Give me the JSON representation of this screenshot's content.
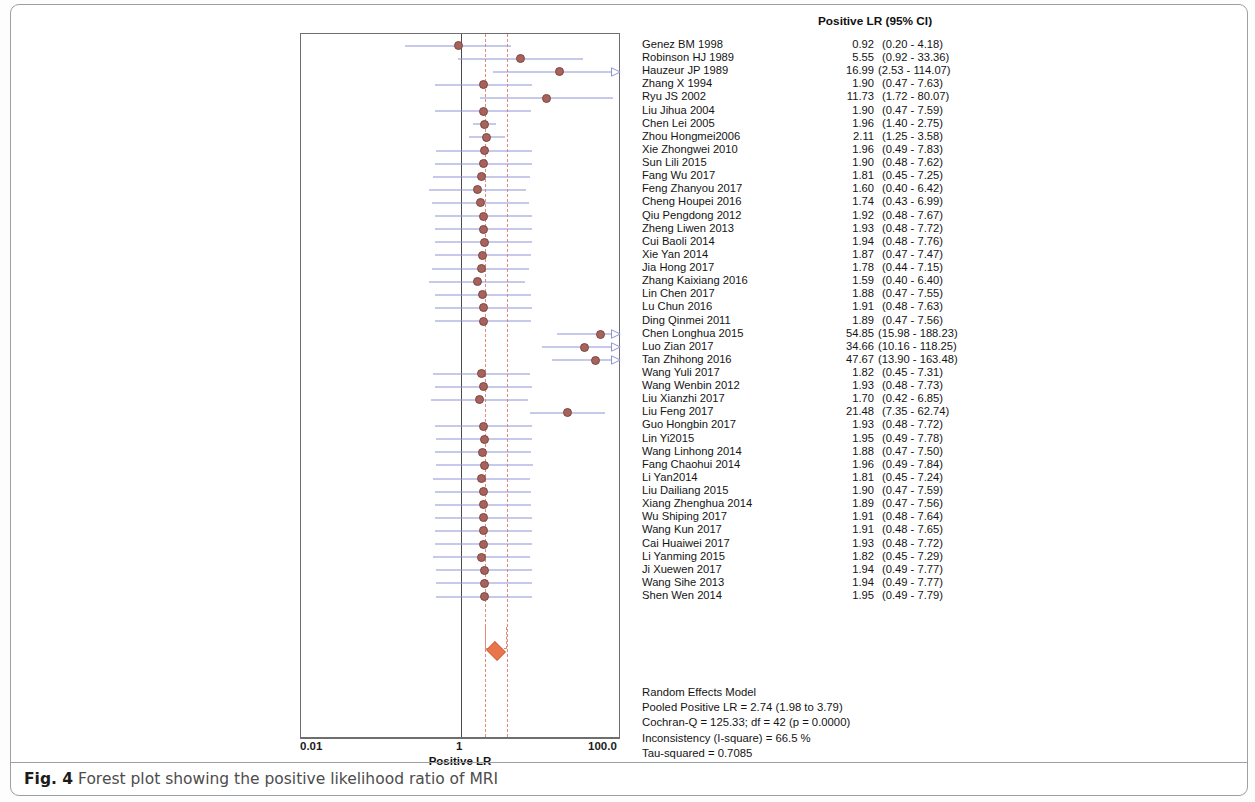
{
  "figure": {
    "caption_label": "Fig. 4",
    "caption_text": "Forest plot showing the positive likelihood ratio of MRI"
  },
  "column_header": "Positive LR (95% CI)",
  "axis": {
    "label": "Positive LR",
    "ticks": [
      "0.01",
      "1",
      "100.0"
    ],
    "min": 0.01,
    "max": 100.0,
    "reference_line": 1,
    "dashed_lines": [
      1.98,
      3.79
    ]
  },
  "summary": {
    "model": "Random Effects Model",
    "pooled": "Pooled Positive LR = 2.74 (1.98 to 3.79)",
    "cochran": "Cochran-Q = 125.33; df =  42 (p = 0.0000)",
    "inconsistency": "Inconsistency (I-square) = 66.5 %",
    "tau": "Tau-squared = 0.7085"
  },
  "colors": {
    "marker": "#a8625c",
    "ci_line": "#8f94d6",
    "dashed": "#e08a7a",
    "diamond": "#e8764a"
  },
  "chart_data": {
    "type": "forest",
    "title": "Forest plot showing the positive likelihood ratio of MRI",
    "xlabel": "Positive LR",
    "ylabel": "",
    "xscale": "log",
    "xlim": [
      0.01,
      100.0
    ],
    "grid": false,
    "reference_value": 1,
    "pooled": {
      "label": "Random Effects Model",
      "estimate": 2.74,
      "ci_low": 1.98,
      "ci_high": 3.79,
      "cochran_q": 125.33,
      "df": 42,
      "p_value": 0.0,
      "i_square": 66.5,
      "tau_squared": 0.7085
    },
    "studies": [
      {
        "name": "Genez BM 1998",
        "est": 0.92,
        "low": 0.2,
        "high": 4.18,
        "est_text": "0.92",
        "ci_text": "(0.20 - 4.18)"
      },
      {
        "name": "Robinson HJ 1989",
        "est": 5.55,
        "low": 0.92,
        "high": 33.36,
        "est_text": "5.55",
        "ci_text": "(0.92 - 33.36)"
      },
      {
        "name": "Hauzeur JP 1989",
        "est": 16.99,
        "low": 2.53,
        "high": 114.07,
        "est_text": "16.99",
        "ci_text": "(2.53 - 114.07)"
      },
      {
        "name": "Zhang X 1994",
        "est": 1.9,
        "low": 0.47,
        "high": 7.63,
        "est_text": "1.90",
        "ci_text": "(0.47 - 7.63)"
      },
      {
        "name": "Ryu JS 2002",
        "est": 11.73,
        "low": 1.72,
        "high": 80.07,
        "est_text": "11.73",
        "ci_text": "(1.72 - 80.07)"
      },
      {
        "name": "Liu Jihua 2004",
        "est": 1.9,
        "low": 0.47,
        "high": 7.59,
        "est_text": "1.90",
        "ci_text": "(0.47 - 7.59)"
      },
      {
        "name": "Chen Lei 2005",
        "est": 1.96,
        "low": 1.4,
        "high": 2.75,
        "est_text": "1.96",
        "ci_text": "(1.40 - 2.75)"
      },
      {
        "name": "Zhou Hongmei2006",
        "est": 2.11,
        "low": 1.25,
        "high": 3.58,
        "est_text": "2.11",
        "ci_text": "(1.25 - 3.58)"
      },
      {
        "name": "Xie Zhongwei 2010",
        "est": 1.96,
        "low": 0.49,
        "high": 7.83,
        "est_text": "1.96",
        "ci_text": "(0.49 - 7.83)"
      },
      {
        "name": "Sun Lili 2015",
        "est": 1.9,
        "low": 0.48,
        "high": 7.62,
        "est_text": "1.90",
        "ci_text": "(0.48 - 7.62)"
      },
      {
        "name": "Fang Wu 2017",
        "est": 1.81,
        "low": 0.45,
        "high": 7.25,
        "est_text": "1.81",
        "ci_text": "(0.45 - 7.25)"
      },
      {
        "name": "Feng Zhanyou 2017",
        "est": 1.6,
        "low": 0.4,
        "high": 6.42,
        "est_text": "1.60",
        "ci_text": "(0.40 - 6.42)"
      },
      {
        "name": "Cheng Houpei 2016",
        "est": 1.74,
        "low": 0.43,
        "high": 6.99,
        "est_text": "1.74",
        "ci_text": "(0.43 - 6.99)"
      },
      {
        "name": "Qiu Pengdong 2012",
        "est": 1.92,
        "low": 0.48,
        "high": 7.67,
        "est_text": "1.92",
        "ci_text": "(0.48 - 7.67)"
      },
      {
        "name": "Zheng Liwen 2013",
        "est": 1.93,
        "low": 0.48,
        "high": 7.72,
        "est_text": "1.93",
        "ci_text": "(0.48 - 7.72)"
      },
      {
        "name": "Cui Baoli 2014",
        "est": 1.94,
        "low": 0.48,
        "high": 7.76,
        "est_text": "1.94",
        "ci_text": "(0.48 - 7.76)"
      },
      {
        "name": "Xie Yan 2014",
        "est": 1.87,
        "low": 0.47,
        "high": 7.47,
        "est_text": "1.87",
        "ci_text": "(0.47 - 7.47)"
      },
      {
        "name": "Jia Hong 2017",
        "est": 1.78,
        "low": 0.44,
        "high": 7.15,
        "est_text": "1.78",
        "ci_text": "(0.44 - 7.15)"
      },
      {
        "name": "Zhang Kaixiang 2016",
        "est": 1.59,
        "low": 0.4,
        "high": 6.4,
        "est_text": "1.59",
        "ci_text": "(0.40 - 6.40)"
      },
      {
        "name": "Lin Chen 2017",
        "est": 1.88,
        "low": 0.47,
        "high": 7.55,
        "est_text": "1.88",
        "ci_text": "(0.47 - 7.55)"
      },
      {
        "name": "Lu Chun 2016",
        "est": 1.91,
        "low": 0.48,
        "high": 7.63,
        "est_text": "1.91",
        "ci_text": "(0.48 - 7.63)"
      },
      {
        "name": "Ding Qinmei 2011",
        "est": 1.89,
        "low": 0.47,
        "high": 7.56,
        "est_text": "1.89",
        "ci_text": "(0.47 - 7.56)"
      },
      {
        "name": "Chen Longhua 2015",
        "est": 54.85,
        "low": 15.98,
        "high": 188.23,
        "est_text": "54.85",
        "ci_text": "(15.98 - 188.23)"
      },
      {
        "name": "Luo Zian 2017",
        "est": 34.66,
        "low": 10.16,
        "high": 118.25,
        "est_text": "34.66",
        "ci_text": "(10.16 - 118.25)"
      },
      {
        "name": "Tan Zhihong 2016",
        "est": 47.67,
        "low": 13.9,
        "high": 163.48,
        "est_text": "47.67",
        "ci_text": "(13.90 - 163.48)"
      },
      {
        "name": "Wang Yuli 2017",
        "est": 1.82,
        "low": 0.45,
        "high": 7.31,
        "est_text": "1.82",
        "ci_text": "(0.45 - 7.31)"
      },
      {
        "name": "Wang Wenbin 2012",
        "est": 1.93,
        "low": 0.48,
        "high": 7.73,
        "est_text": "1.93",
        "ci_text": "(0.48 - 7.73)"
      },
      {
        "name": "Liu Xianzhi 2017",
        "est": 1.7,
        "low": 0.42,
        "high": 6.85,
        "est_text": "1.70",
        "ci_text": "(0.42 - 6.85)"
      },
      {
        "name": "Liu Feng 2017",
        "est": 21.48,
        "low": 7.35,
        "high": 62.74,
        "est_text": "21.48",
        "ci_text": "(7.35 - 62.74)"
      },
      {
        "name": "Guo Hongbin 2017",
        "est": 1.93,
        "low": 0.48,
        "high": 7.72,
        "est_text": "1.93",
        "ci_text": "(0.48 - 7.72)"
      },
      {
        "name": "Lin Yi2015",
        "est": 1.95,
        "low": 0.49,
        "high": 7.78,
        "est_text": "1.95",
        "ci_text": "(0.49 - 7.78)"
      },
      {
        "name": "Wang Linhong 2014",
        "est": 1.88,
        "low": 0.47,
        "high": 7.5,
        "est_text": "1.88",
        "ci_text": "(0.47 - 7.50)"
      },
      {
        "name": "Fang Chaohui 2014",
        "est": 1.96,
        "low": 0.49,
        "high": 7.84,
        "est_text": "1.96",
        "ci_text": "(0.49 - 7.84)"
      },
      {
        "name": "Li Yan2014",
        "est": 1.81,
        "low": 0.45,
        "high": 7.24,
        "est_text": "1.81",
        "ci_text": "(0.45 - 7.24)"
      },
      {
        "name": "Liu Dailiang 2015",
        "est": 1.9,
        "low": 0.47,
        "high": 7.59,
        "est_text": "1.90",
        "ci_text": "(0.47 - 7.59)"
      },
      {
        "name": "Xiang Zhenghua 2014",
        "est": 1.89,
        "low": 0.47,
        "high": 7.56,
        "est_text": "1.89",
        "ci_text": "(0.47 - 7.56)"
      },
      {
        "name": "Wu Shiping 2017",
        "est": 1.91,
        "low": 0.48,
        "high": 7.64,
        "est_text": "1.91",
        "ci_text": "(0.48 - 7.64)"
      },
      {
        "name": "Wang Kun 2017",
        "est": 1.91,
        "low": 0.48,
        "high": 7.65,
        "est_text": "1.91",
        "ci_text": "(0.48 - 7.65)"
      },
      {
        "name": "Cai Huaiwei 2017",
        "est": 1.93,
        "low": 0.48,
        "high": 7.72,
        "est_text": "1.93",
        "ci_text": "(0.48 - 7.72)"
      },
      {
        "name": "Li Yanming 2015",
        "est": 1.82,
        "low": 0.45,
        "high": 7.29,
        "est_text": "1.82",
        "ci_text": "(0.45 - 7.29)"
      },
      {
        "name": "Ji Xuewen 2017",
        "est": 1.94,
        "low": 0.49,
        "high": 7.77,
        "est_text": "1.94",
        "ci_text": "(0.49 - 7.77)"
      },
      {
        "name": "Wang Sihe 2013",
        "est": 1.94,
        "low": 0.49,
        "high": 7.77,
        "est_text": "1.94",
        "ci_text": "(0.49 - 7.77)"
      },
      {
        "name": "Shen Wen 2014",
        "est": 1.95,
        "low": 0.49,
        "high": 7.79,
        "est_text": "1.95",
        "ci_text": "(0.49 - 7.79)"
      }
    ]
  }
}
